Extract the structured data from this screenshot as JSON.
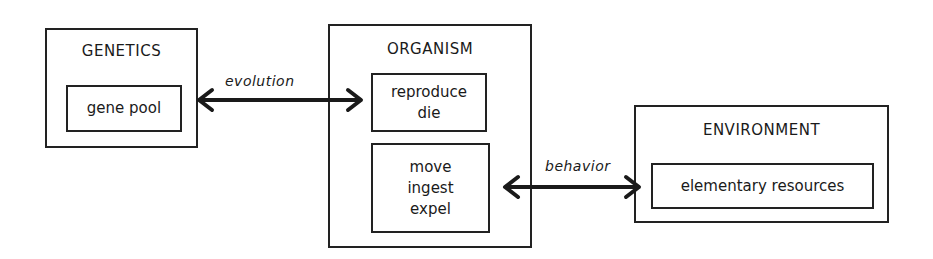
{
  "diagram": {
    "genetics": {
      "title": "GENETICS",
      "inner": [
        "gene pool"
      ]
    },
    "organism": {
      "title": "ORGANISM",
      "inner_top": [
        "reproduce",
        "die"
      ],
      "inner_bottom": [
        "move",
        "ingest",
        "expel"
      ]
    },
    "environment": {
      "title": "ENVIRONMENT",
      "inner": [
        "elementary resources"
      ]
    },
    "arrows": [
      {
        "label": "evolution",
        "from": "genetics",
        "to": "organism",
        "direction": "bidirectional"
      },
      {
        "label": "behavior",
        "from": "organism",
        "to": "environment",
        "direction": "bidirectional"
      }
    ],
    "stroke_color": "#222222"
  }
}
